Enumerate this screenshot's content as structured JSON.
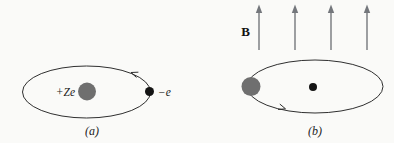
{
  "panels": {
    "a": {
      "caption": "(a)",
      "nucleus_label": "+Ze",
      "electron_label": "−e"
    },
    "b": {
      "caption": "(b)",
      "field_label": "B"
    }
  },
  "colors": {
    "background": "#fafaf8",
    "orbit_line": "#2f2f2f",
    "sphere_gray": "#6f6f6f",
    "dot_black": "#141414",
    "field_arrow_gray": "#74777c",
    "text": "#1c1c1c"
  }
}
